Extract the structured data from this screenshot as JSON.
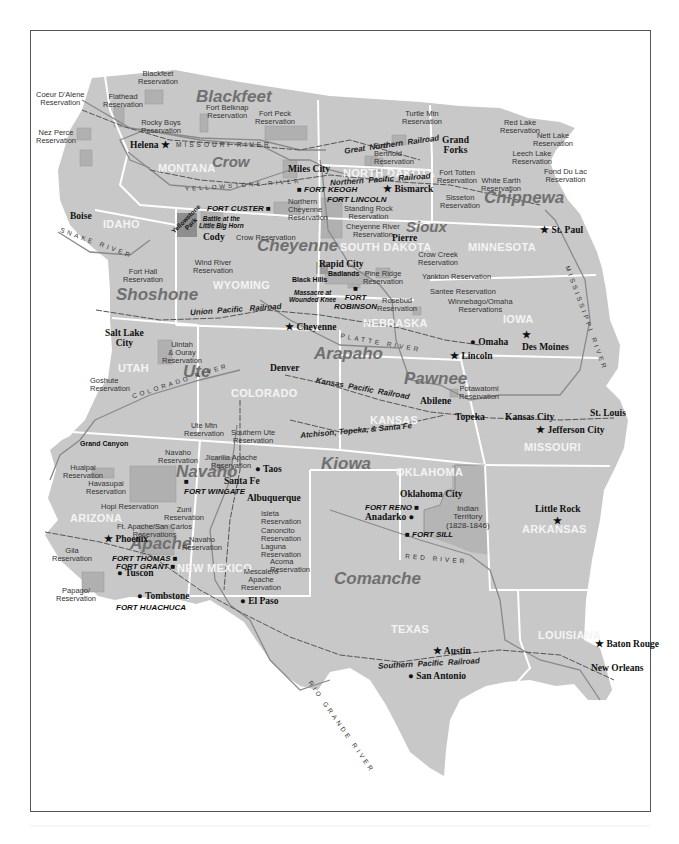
{
  "map": {
    "title": "",
    "colors": {
      "land": "#c8c8c8",
      "reservation": "#b3b3b3",
      "state_border": "#ffffff",
      "river": "#8a8a8a",
      "railroad": "#555555",
      "frame": "#555555"
    }
  },
  "tribes": {
    "blackfeet": "Blackfeet",
    "crow": "Crow",
    "chippewa": "Chippewa",
    "sioux": "Sioux",
    "cheyenne": "Cheyenne",
    "shoshone": "Shoshone",
    "arapaho": "Arapaho",
    "ute": "Ute",
    "pawnee": "Pawnee",
    "kiowa": "Kiowa",
    "navaho": "Navaho",
    "apache": "Apache",
    "comanche": "Comanche"
  },
  "states": {
    "montana": "MONTANA",
    "north_dakota": "NORTH DAKOTA",
    "idaho": "IDAHO",
    "south_dakota": "SOUTH DAKOTA",
    "minnesota": "MINNESOTA",
    "wyoming": "WYOMING",
    "nebraska": "NEBRASKA",
    "iowa": "IOWA",
    "utah": "UTAH",
    "colorado": "COLORADO",
    "kansas": "KANSAS",
    "missouri": "MISSOURI",
    "oklahoma": "OKLAHOMA",
    "arkansas": "ARKANSAS",
    "arizona": "ARIZONA",
    "new_mexico": "NEW MEXICO",
    "texas": "TEXAS",
    "louisiana": "LOUISIANA"
  },
  "cities": {
    "helena": "Helena",
    "miles_city": "Miles City",
    "bismarck": "Bismarck",
    "grand_forks_1": "Grand",
    "grand_forks_2": "Forks",
    "boise": "Boise",
    "cody": "Cody",
    "pierre": "Pierre",
    "st_paul": "St. Paul",
    "rapid_city": "Rapid City",
    "salt_lake_1": "Salt Lake",
    "salt_lake_2": "City",
    "cheyenne": "Cheyenne",
    "omaha": "Omaha",
    "des_moines": "Des Moines",
    "lincoln": "Lincoln",
    "denver": "Denver",
    "abilene": "Abilene",
    "topeka": "Topeka",
    "kansas_city": "Kansas City",
    "st_louis": "St. Louis",
    "jefferson_city": "Jefferson City",
    "taos": "Taos",
    "santa_fe": "Santa Fe",
    "albuquerque": "Albuquerque",
    "oklahoma_city": "Oklahoma City",
    "anadarko": "Anadarko",
    "little_rock": "Little Rock",
    "phoenix": "Phoenix",
    "tuscon": "Tuscon",
    "tombstone": "Tombstone",
    "el_paso": "El Paso",
    "austin": "Austin",
    "san_antonio": "San Antonio",
    "baton_rouge": "Baton Rouge",
    "new_orleans": "New Orleans"
  },
  "forts": {
    "keogh": "FORT KEOGH",
    "lincoln": "FORT LINCOLN",
    "custer": "FORT CUSTER",
    "robinson_1": "FORT",
    "robinson_2": "ROBINSON",
    "wingate": "FORT WINGATE",
    "reno": "FORT RENO",
    "sill": "FORT SILL",
    "thomas": "FORT THOMAS",
    "grant": "FORT GRANT",
    "huachuca": "FORT HUACHUCA"
  },
  "reservations": {
    "blackfeet": [
      "Blackfeet",
      "Reservation"
    ],
    "coeur_dalene": [
      "Coeur D'Alene",
      "Reservation"
    ],
    "flathead": [
      "Flathead",
      "Reservation"
    ],
    "fort_belknap": [
      "Fort Belknap",
      "Reservation"
    ],
    "fort_peck": [
      "Fort Peck",
      "Reservation"
    ],
    "rocky_boys": [
      "Rocky Boys",
      "Reservation"
    ],
    "nez_perce": [
      "Nez Perce",
      "Reservation"
    ],
    "turtle_mtn": [
      "Turtle Mtn",
      "Reservation"
    ],
    "red_lake": [
      "Red Lake",
      "Reservation"
    ],
    "nett_lake": [
      "Nett Lake",
      "Reservation"
    ],
    "fort_berthold": [
      "Fort",
      "Berthold",
      "Reservation"
    ],
    "leech_lake": [
      "Leech Lake",
      "Reservation"
    ],
    "fond_du_lac": [
      "Fond Du Lac",
      "Reservation"
    ],
    "fort_totten": [
      "Fort Totten",
      "Reservation"
    ],
    "white_earth": [
      "White Earth",
      "Reservation"
    ],
    "northern_cheyenne": [
      "Northern",
      "Cheyenne",
      "Reservation"
    ],
    "standing_rock": [
      "Standing Rock",
      "Reservation"
    ],
    "sisseton": [
      "Sisseton",
      "Reservation"
    ],
    "crow": [
      "Crow Reservation"
    ],
    "cheyenne_river": [
      "Cheyenne River",
      "Reservation"
    ],
    "fort_hall": [
      "Fort Hall",
      "Reservation"
    ],
    "wind_river": [
      "Wind River",
      "Reservation"
    ],
    "crow_creek": [
      "Crow Creek",
      "Reservation"
    ],
    "pine_ridge": [
      "Pine Ridge",
      "Reservation"
    ],
    "yankton": [
      "Yankton Reservation"
    ],
    "rosebud": [
      "Rosebud",
      "Reservation"
    ],
    "santee": [
      "Santee Reservation"
    ],
    "winnebago_omaha": [
      "Winnebago/Omaha",
      "Reservations"
    ],
    "uintah_ouray": [
      "Uintah",
      "& Ouray",
      "Reservation"
    ],
    "goshute": [
      "Goshute",
      "Reservation"
    ],
    "potawatomi": [
      "Potawatomi",
      "Reservation"
    ],
    "ute_mtn": [
      "Ute Mtn",
      "Reservation"
    ],
    "southern_ute": [
      "Southern Ute",
      "Reservation"
    ],
    "hualpai": [
      "Hualpai",
      "Reservation"
    ],
    "navaho": [
      "Navaho",
      "Reservation"
    ],
    "jicarilla": [
      "Jicarilla Apache",
      "Reservation"
    ],
    "havasupai": [
      "Havasupai",
      "Reservation"
    ],
    "hopi": [
      "Hopi Reservation"
    ],
    "zuni": [
      "Zuni",
      "Reservation"
    ],
    "isleta": [
      "Isleta",
      "Reservation"
    ],
    "canoncito": [
      "Canoncito",
      "Reservation"
    ],
    "ft_apache": [
      "Ft. Apache/San Carlos",
      "Reservations"
    ],
    "navaho_nm": [
      "Navaho",
      "Reservation"
    ],
    "laguna": [
      "Laguna",
      "Reservation"
    ],
    "gila": [
      "Gila",
      "Reservation"
    ],
    "acoma": [
      "Acoma",
      "Reservation"
    ],
    "mescalero": [
      "Mescalero",
      "Apache",
      "Reservation"
    ],
    "papago": [
      "Papago",
      "Reservation"
    ]
  },
  "landmarks": {
    "yellowstone": [
      "Yellowstone",
      "Park"
    ],
    "little_big_horn": [
      "Battle at the",
      "Little Big Horn"
    ],
    "badlands": "Badlands",
    "black_hills": "Black Hills",
    "wounded_knee": [
      "Massacre at",
      "Wounded Knee"
    ],
    "grand_canyon": "Grand Canyon",
    "indian_territory": [
      "Indian",
      "Territory",
      "(1828-1846)"
    ]
  },
  "railroads": {
    "great_northern": [
      "Great",
      "Northern",
      "Railroad"
    ],
    "northern_pacific": [
      "Northern",
      "Pacific",
      "Railroad"
    ],
    "union_pacific": [
      "Union",
      "Pacific",
      "Railroad"
    ],
    "kansas_pacific": [
      "Kansas",
      "Pacific",
      "Railroad"
    ],
    "atchison": [
      "Atchison,",
      "Topeka,",
      "& Santa Fe"
    ],
    "southern_pacific": [
      "Southern",
      "Pacific",
      "Railroad"
    ]
  },
  "rivers": {
    "missouri": "MISSOURI RIVER",
    "yellowstone": "YELLOWSTONE RIVER",
    "snake": "SNAKE RIVER",
    "mississippi": "MISSISSIPPI RIVER",
    "platte": "PLATTE RIVER",
    "colorado": "COLORADO RIVER",
    "red": "RED RIVER",
    "rio_grande": "RIO GRANDE RIVER"
  }
}
